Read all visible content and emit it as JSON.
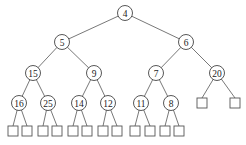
{
  "diagram": {
    "type": "binary-tree",
    "nodes": [
      {
        "id": "n4",
        "label": "4",
        "x": 125,
        "y": 13
      },
      {
        "id": "n5",
        "label": "5",
        "x": 62,
        "y": 42
      },
      {
        "id": "n6",
        "label": "6",
        "x": 186,
        "y": 42
      },
      {
        "id": "n15",
        "label": "15",
        "x": 33,
        "y": 73
      },
      {
        "id": "n9",
        "label": "9",
        "x": 94,
        "y": 73
      },
      {
        "id": "n7",
        "label": "7",
        "x": 156,
        "y": 73
      },
      {
        "id": "n20",
        "label": "20",
        "x": 217,
        "y": 73
      },
      {
        "id": "n16",
        "label": "16",
        "x": 19,
        "y": 103
      },
      {
        "id": "n25",
        "label": "25",
        "x": 48,
        "y": 103
      },
      {
        "id": "n14",
        "label": "14",
        "x": 79,
        "y": 103
      },
      {
        "id": "n12",
        "label": "12",
        "x": 108,
        "y": 103
      },
      {
        "id": "n11",
        "label": "11",
        "x": 141,
        "y": 103
      },
      {
        "id": "n8",
        "label": "8",
        "x": 171,
        "y": 103
      }
    ],
    "edges": [
      [
        "n4",
        "n5"
      ],
      [
        "n4",
        "n6"
      ],
      [
        "n5",
        "n15"
      ],
      [
        "n5",
        "n9"
      ],
      [
        "n6",
        "n7"
      ],
      [
        "n6",
        "n20"
      ],
      [
        "n15",
        "n16"
      ],
      [
        "n15",
        "n25"
      ],
      [
        "n9",
        "n14"
      ],
      [
        "n9",
        "n12"
      ],
      [
        "n7",
        "n11"
      ],
      [
        "n7",
        "n8"
      ]
    ],
    "leaves": [
      {
        "parent": "n16",
        "x": 13,
        "y": 131
      },
      {
        "parent": "n16",
        "x": 27,
        "y": 131
      },
      {
        "parent": "n25",
        "x": 43,
        "y": 131
      },
      {
        "parent": "n25",
        "x": 57,
        "y": 131
      },
      {
        "parent": "n14",
        "x": 73,
        "y": 131
      },
      {
        "parent": "n14",
        "x": 87,
        "y": 131
      },
      {
        "parent": "n12",
        "x": 103,
        "y": 131
      },
      {
        "parent": "n12",
        "x": 117,
        "y": 131
      },
      {
        "parent": "n11",
        "x": 135,
        "y": 131
      },
      {
        "parent": "n11",
        "x": 150,
        "y": 131
      },
      {
        "parent": "n8",
        "x": 165,
        "y": 131
      },
      {
        "parent": "n8",
        "x": 179,
        "y": 131
      },
      {
        "parent": "n20",
        "x": 202,
        "y": 103
      },
      {
        "parent": "n20",
        "x": 235,
        "y": 103
      }
    ],
    "style": {
      "node_radius": 7.5,
      "leaf_size": 10,
      "stroke_color": "#444444",
      "background": "#ffffff"
    }
  }
}
